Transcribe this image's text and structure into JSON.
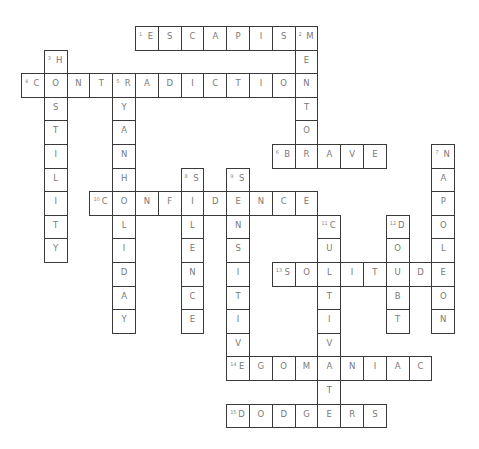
{
  "puzzle": {
    "grid": {
      "origin_x": 21,
      "origin_y": 26,
      "cell_w": 22.8,
      "cell_h": 23.6
    },
    "words": [
      {
        "number": 1,
        "answer": "ESCAPISM",
        "direction": "across",
        "row": 0,
        "col": 5
      },
      {
        "number": 2,
        "answer": "MENTOR",
        "direction": "down",
        "row": 0,
        "col": 12
      },
      {
        "number": 3,
        "answer": "HOSTILITY",
        "direction": "down",
        "row": 1,
        "col": 1
      },
      {
        "number": 4,
        "answer": "CONTRADICTION",
        "direction": "across",
        "row": 2,
        "col": 0
      },
      {
        "number": 5,
        "answer": "RYANHOLIDAY",
        "direction": "down",
        "row": 2,
        "col": 4
      },
      {
        "number": 6,
        "answer": "BRAVE",
        "direction": "across",
        "row": 5,
        "col": 11
      },
      {
        "number": 7,
        "answer": "NAPOLEON",
        "direction": "down",
        "row": 5,
        "col": 18
      },
      {
        "number": 8,
        "answer": "SILENCE",
        "direction": "down",
        "row": 6,
        "col": 7
      },
      {
        "number": 9,
        "answer": "SENSITIVE",
        "direction": "down",
        "row": 6,
        "col": 9
      },
      {
        "number": 10,
        "answer": "CONFIDENCE",
        "direction": "across",
        "row": 7,
        "col": 3
      },
      {
        "number": 11,
        "answer": "CULTIVATE",
        "direction": "down",
        "row": 8,
        "col": 13
      },
      {
        "number": 12,
        "answer": "DOUBT",
        "direction": "down",
        "row": 8,
        "col": 16
      },
      {
        "number": 13,
        "answer": "SOLITUDE",
        "direction": "across",
        "row": 10,
        "col": 11
      },
      {
        "number": 14,
        "answer": "EGOMANIAC",
        "direction": "across",
        "row": 14,
        "col": 9
      },
      {
        "number": 15,
        "answer": "DODGERS",
        "direction": "across",
        "row": 16,
        "col": 9
      }
    ]
  },
  "colors": {
    "line": "#3a3a3a",
    "letter": "#7a7a7a",
    "number": "#888888",
    "background": "#ffffff"
  }
}
